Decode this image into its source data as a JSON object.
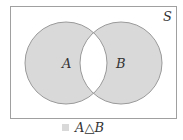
{
  "diagram": {
    "universe_label": "S",
    "set_a_label": "A",
    "set_b_label": "B",
    "legend_label": "A△B",
    "colors": {
      "fill": "#d9d9d9",
      "stroke": "#9a9a9a",
      "frame": "#a0a0a0",
      "text": "#333333"
    }
  }
}
